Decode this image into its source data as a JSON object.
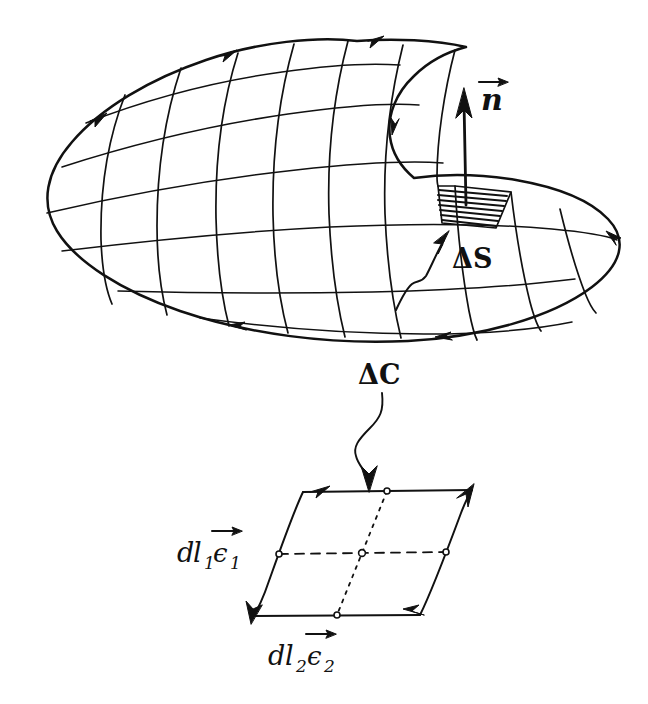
{
  "figure": {
    "background_color": "#ffffff",
    "ink_color": "#111111",
    "width": 648,
    "height": 704
  },
  "surface": {
    "name": "oriented-curved-surface",
    "description": "kidney / saddle shaped curved surface drawn in perspective with a curvilinear coordinate mesh",
    "boundary_orientation": "counterclockwise",
    "grid_u_count": 9,
    "grid_v_count": 4
  },
  "labels": {
    "normal_vector": "n",
    "normal_vector_accent": "→",
    "surface_element": "ΔS",
    "boundary_element": "ΔC",
    "edge1_d": "d",
    "edge1_l": "l",
    "edge1_sub": "1",
    "edge1_basis": "ϵ",
    "edge1_basis_sub": "1",
    "edge1_accent": "→",
    "edge2_d": "d",
    "edge2_l": "l",
    "edge2_sub": "2",
    "edge2_basis": "ϵ",
    "edge2_basis_sub": "2",
    "edge2_accent": "→"
  },
  "annotations": {
    "normal_vector_caption": "unit normal to the surface element",
    "surface_element_caption": "hatched surface patch delta S",
    "boundary_element_caption": "boundary arc element delta C",
    "inset_caption": "enlarged parallelogram surface element spanned by dl1 e1 and dl2 e2"
  },
  "inset": {
    "name": "parallelogram-surface-element",
    "edge_arrow_directions": [
      "top-left",
      "left-down",
      "bottom-right",
      "right-up"
    ],
    "median_lines": [
      "horizontal-dashed",
      "vertical-dotted"
    ],
    "midpoint_markers": 5
  }
}
